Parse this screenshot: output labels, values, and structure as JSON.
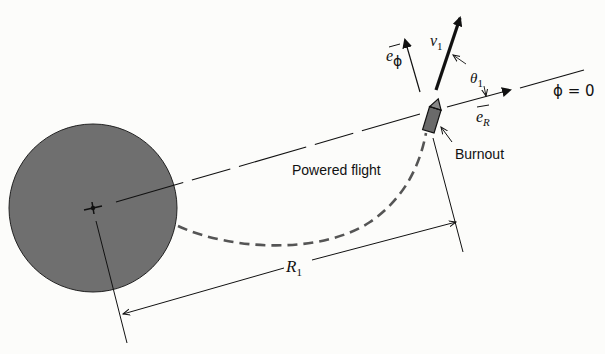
{
  "diagram": {
    "labels": {
      "powered_flight": "Powered flight",
      "burnout": "Burnout",
      "velocity": "v",
      "velocity_sub": "1",
      "angle": "θ",
      "angle_sub": "1",
      "e_phi": "e",
      "e_phi_sub": "ϕ",
      "e_R": "e",
      "e_R_sub": "R",
      "phi_zero": "ϕ = 0",
      "radius": "R",
      "radius_sub": "1"
    },
    "colors": {
      "planet_fill": "#6f6f6f",
      "rocket_fill": "#6a6a6a",
      "line": "#111111",
      "dashed_trajectory": "#555555",
      "background": "#fcfcfa"
    }
  }
}
